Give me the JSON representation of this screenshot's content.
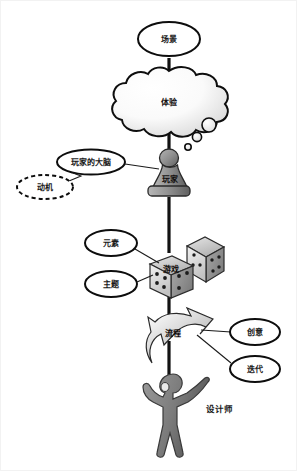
{
  "diagram": {
    "background_color": "#ffffff",
    "nodes": {
      "scene": {
        "label": "场景",
        "shape": "ellipse-outline"
      },
      "experience": {
        "label": "体验",
        "shape": "thought-cloud"
      },
      "player_brain": {
        "label": "玩家的大脑",
        "shape": "ellipse-outline"
      },
      "motivation": {
        "label": "动机",
        "shape": "ellipse-dashed"
      },
      "player": {
        "label": "玩家",
        "shape": "chess-pawn"
      },
      "elements": {
        "label": "元素",
        "shape": "ellipse-outline"
      },
      "theme": {
        "label": "主题",
        "shape": "ellipse-outline"
      },
      "game": {
        "label": "游戏",
        "shape": "dice-pair"
      },
      "process": {
        "label": "流程",
        "shape": "swirl-arrow"
      },
      "creativity": {
        "label": "创意",
        "shape": "ellipse-outline"
      },
      "iteration": {
        "label": "迭代",
        "shape": "ellipse-outline"
      },
      "designer": {
        "label": "设计师",
        "shape": "human-figure"
      }
    },
    "colors": {
      "outline": "#0d0d0d",
      "spine": "#121212",
      "pawn_fill": "#8d8d8d",
      "dice_fill": "#c9c9c9",
      "designer_fill": "#7e7e7e",
      "arrow_fill": "#d8d8d8",
      "cloud_fill": "#f7f7f7"
    },
    "connections": [
      {
        "from": "scene",
        "to": "experience"
      },
      {
        "from": "experience",
        "to": "player"
      },
      {
        "from": "player_brain",
        "to": "player"
      },
      {
        "from": "motivation",
        "to": "player_brain"
      },
      {
        "from": "player",
        "to": "game"
      },
      {
        "from": "elements",
        "to": "game"
      },
      {
        "from": "theme",
        "to": "game"
      },
      {
        "from": "game",
        "to": "process"
      },
      {
        "from": "creativity",
        "to": "process"
      },
      {
        "from": "iteration",
        "to": "process"
      },
      {
        "from": "process",
        "to": "designer"
      }
    ]
  }
}
